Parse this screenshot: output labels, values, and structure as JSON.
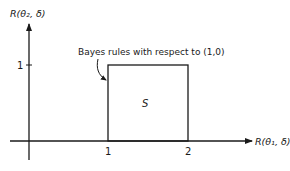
{
  "diagram": {
    "y_axis": {
      "label": "R(θ₂, δ)",
      "tick": "1"
    },
    "x_axis": {
      "label": "R(θ₁, δ)",
      "ticks": [
        "1",
        "2"
      ]
    },
    "region_label": "S",
    "annotation": "Bayes rules with respect to (1,0)",
    "colors": {
      "ink": "#1a1a1a",
      "background": "#ffffff"
    }
  }
}
